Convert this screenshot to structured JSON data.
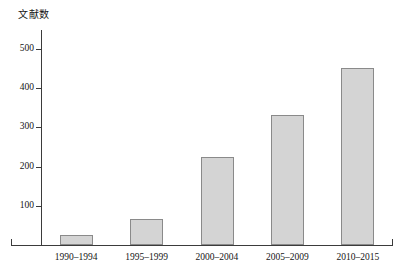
{
  "chart_data": {
    "type": "bar",
    "title": "",
    "subtitle": "",
    "xlabel": "",
    "ylabel": "文献数",
    "categories": [
      "1990–1994",
      "1995–1999",
      "2000–2004",
      "2005–2009",
      "2010–2015"
    ],
    "values": [
      25,
      65,
      225,
      330,
      450
    ],
    "ylim": [
      0,
      530
    ],
    "yticks": [
      100,
      200,
      300,
      400,
      500
    ],
    "ytick_labels": [
      "100",
      "200",
      "300",
      "400",
      "500"
    ],
    "grid": false,
    "legend": null,
    "legend_position": "none",
    "bar_fill_color": "#d4d4d4",
    "bar_border_color": "#8a8a8a",
    "axis_color": "#3b3b3b",
    "background_color": "#ffffff"
  },
  "axes": {
    "y_title": "文献数",
    "y_ticks": [
      {
        "label": "500",
        "value": 500
      },
      {
        "label": "400",
        "value": 400
      },
      {
        "label": "300",
        "value": 300
      },
      {
        "label": "200",
        "value": 200
      },
      {
        "label": "100",
        "value": 100
      }
    ],
    "x_ticks": [
      {
        "label": "1990–1994"
      },
      {
        "label": "1995–1999"
      },
      {
        "label": "2000–2004"
      },
      {
        "label": "2005–2009"
      },
      {
        "label": "2010–2015"
      }
    ]
  }
}
